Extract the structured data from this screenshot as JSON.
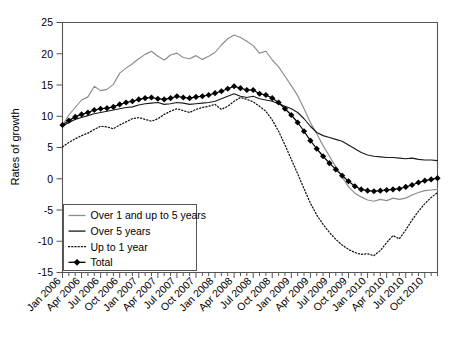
{
  "chart_data": {
    "type": "line",
    "title": "",
    "xlabel": "",
    "ylabel": "Rates of growth",
    "ylim": [
      -15,
      25
    ],
    "yticks": [
      -15,
      -10,
      -5,
      0,
      5,
      10,
      15,
      20,
      25
    ],
    "ytick_labels": [
      "-15",
      "-10",
      "-5",
      "0",
      "5",
      "10",
      "15",
      "20",
      "25"
    ],
    "grid": false,
    "legend_position": "lower-left",
    "x_tick_interval": "monthly",
    "x_label_interval": "quarterly",
    "x": [
      "Jan 2006",
      "Feb 2006",
      "Mar 2006",
      "Apr 2006",
      "May 2006",
      "Jun 2006",
      "Jul 2006",
      "Aug 2006",
      "Sep 2006",
      "Oct 2006",
      "Nov 2006",
      "Dec 2006",
      "Jan 2007",
      "Feb 2007",
      "Mar 2007",
      "Apr 2007",
      "May 2007",
      "Jun 2007",
      "Jul 2007",
      "Aug 2007",
      "Sep 2007",
      "Oct 2007",
      "Nov 2007",
      "Dec 2007",
      "Jan 2008",
      "Feb 2008",
      "Mar 2008",
      "Apr 2008",
      "May 2008",
      "Jun 2008",
      "Jul 2008",
      "Aug 2008",
      "Sep 2008",
      "Oct 2008",
      "Nov 2008",
      "Dec 2008",
      "Jan 2009",
      "Feb 2009",
      "Mar 2009",
      "Apr 2009",
      "May 2009",
      "Jun 2009",
      "Jul 2009",
      "Aug 2009",
      "Sep 2009",
      "Oct 2009",
      "Nov 2009",
      "Dec 2009",
      "Jan 2010",
      "Feb 2010",
      "Mar 2010",
      "Apr 2010",
      "May 2010",
      "Jun 2010",
      "Jul 2010",
      "Aug 2010",
      "Sep 2010",
      "Oct 2010",
      "Nov 2010",
      "Dec 2010"
    ],
    "xtick_labels": [
      "Jan 2006",
      "Apr 2006",
      "Jul 2006",
      "Oct 2006",
      "Jan 2007",
      "Apr 2007",
      "Jul 2007",
      "Oct 2007",
      "Jan 2008",
      "Apr 2008",
      "Jul 2008",
      "Oct 2008",
      "Jan 2009",
      "Apr 2009",
      "Jul 2009",
      "Oct 2009",
      "Jan 2010",
      "Apr 2010",
      "Jul 2010",
      "Oct 2010"
    ],
    "series": [
      {
        "name": "Over 1 and up to 5 years",
        "style": "solid",
        "color": "#8c8c8c",
        "marker": "none",
        "values": [
          8.6,
          10.2,
          11.4,
          12.6,
          13.1,
          14.8,
          14.1,
          14.3,
          15.1,
          16.9,
          17.7,
          18.4,
          19.2,
          19.9,
          20.4,
          19.6,
          19.0,
          19.8,
          20.1,
          19.4,
          19.2,
          19.7,
          19.1,
          19.6,
          20.2,
          21.4,
          22.4,
          23.0,
          22.6,
          22.0,
          21.3,
          20.1,
          20.4,
          19.0,
          17.9,
          16.4,
          14.9,
          13.3,
          11.2,
          9.0,
          7.2,
          5.3,
          3.6,
          1.9,
          0.3,
          -1.3,
          -2.3,
          -2.9,
          -3.4,
          -3.6,
          -3.3,
          -3.5,
          -3.1,
          -3.3,
          -3.1,
          -2.6,
          -2.2,
          -1.9,
          -1.8,
          -1.7
        ]
      },
      {
        "name": "Over 5 years",
        "style": "solid",
        "color": "#1a1a1a",
        "marker": "none",
        "values": [
          8.4,
          9.0,
          9.5,
          9.8,
          10.1,
          10.4,
          10.6,
          10.8,
          11.0,
          11.2,
          11.4,
          11.5,
          11.8,
          12.0,
          12.1,
          12.2,
          11.9,
          12.0,
          12.2,
          12.1,
          11.9,
          12.0,
          12.1,
          12.2,
          12.4,
          12.8,
          13.2,
          13.6,
          13.2,
          13.0,
          13.2,
          12.8,
          12.6,
          12.4,
          12.0,
          11.6,
          11.2,
          10.6,
          9.6,
          8.4,
          7.4,
          6.9,
          6.6,
          6.3,
          6.0,
          5.4,
          4.8,
          4.2,
          3.8,
          3.6,
          3.5,
          3.4,
          3.4,
          3.3,
          3.2,
          3.3,
          3.1,
          3.0,
          3.0,
          2.9
        ]
      },
      {
        "name": "Up to 1 year",
        "style": "dotted",
        "color": "#111111",
        "marker": "none",
        "values": [
          5.1,
          5.8,
          6.4,
          6.9,
          7.3,
          7.9,
          8.4,
          8.3,
          8.0,
          8.6,
          9.1,
          9.6,
          9.8,
          9.5,
          9.2,
          9.6,
          10.3,
          10.8,
          11.2,
          10.9,
          10.6,
          11.1,
          11.4,
          11.6,
          11.9,
          11.1,
          11.6,
          12.4,
          13.0,
          12.7,
          12.3,
          11.6,
          10.8,
          9.4,
          7.6,
          5.4,
          3.1,
          0.8,
          -1.6,
          -3.9,
          -5.8,
          -7.3,
          -8.6,
          -9.7,
          -10.6,
          -11.3,
          -11.8,
          -12.1,
          -12.0,
          -12.3,
          -11.5,
          -10.2,
          -9.1,
          -9.6,
          -8.2,
          -6.6,
          -5.2,
          -4.0,
          -3.0,
          -2.2
        ]
      },
      {
        "name": "Total",
        "style": "solid",
        "color": "#000000",
        "marker": "diamond",
        "values": [
          8.6,
          9.3,
          9.9,
          10.3,
          10.6,
          11.0,
          11.2,
          11.3,
          11.5,
          11.9,
          12.2,
          12.4,
          12.7,
          12.9,
          13.0,
          12.8,
          12.7,
          12.9,
          13.2,
          13.0,
          12.9,
          13.1,
          13.2,
          13.4,
          13.7,
          14.0,
          14.4,
          14.8,
          14.5,
          14.2,
          14.2,
          13.6,
          13.4,
          12.9,
          12.2,
          11.2,
          10.2,
          9.0,
          7.6,
          6.1,
          4.8,
          3.6,
          2.5,
          1.5,
          0.5,
          -0.4,
          -1.2,
          -1.7,
          -1.9,
          -2.0,
          -1.9,
          -1.8,
          -1.7,
          -1.6,
          -1.3,
          -1.0,
          -0.6,
          -0.3,
          -0.1,
          0.1
        ]
      }
    ],
    "legend_entries": [
      {
        "label": "Over 1 and up to 5 years",
        "style": "solid",
        "color": "#8c8c8c",
        "marker": "none"
      },
      {
        "label": "Over 5 years",
        "style": "solid",
        "color": "#1a1a1a",
        "marker": "none"
      },
      {
        "label": "Up to 1 year",
        "style": "dotted",
        "color": "#111111",
        "marker": "none"
      },
      {
        "label": "Total",
        "style": "solid",
        "color": "#000000",
        "marker": "diamond"
      }
    ]
  }
}
